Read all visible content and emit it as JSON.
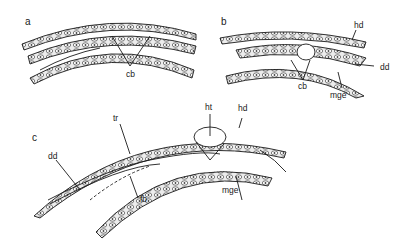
{
  "figure": {
    "panels": [
      {
        "id": "a",
        "label": "a",
        "annotations": [
          {
            "text": "cb"
          }
        ]
      },
      {
        "id": "b",
        "label": "b",
        "annotations": [
          {
            "text": "hd"
          },
          {
            "text": "dd"
          },
          {
            "text": "cb"
          },
          {
            "text": "mge"
          }
        ]
      },
      {
        "id": "c",
        "label": "c",
        "annotations": [
          {
            "text": "tr"
          },
          {
            "text": "ht"
          },
          {
            "text": "hd"
          },
          {
            "text": "dd"
          },
          {
            "text": "mge"
          },
          {
            "text": "fb"
          }
        ]
      }
    ],
    "colors": {
      "ink": "#1a1a1a",
      "fill": "#e8e8e8",
      "background": "#ffffff"
    }
  }
}
